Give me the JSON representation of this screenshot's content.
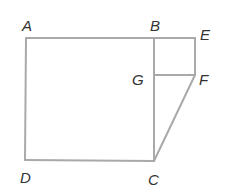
{
  "diagram": {
    "type": "geometry-figure",
    "line_color": "#a9a9a9",
    "label_color": "#333333",
    "points": {
      "A": {
        "label": "A",
        "x": 26,
        "y": 38
      },
      "B": {
        "label": "B",
        "x": 154,
        "y": 38
      },
      "E": {
        "label": "E",
        "x": 195,
        "y": 38
      },
      "G": {
        "label": "G",
        "x": 154,
        "y": 75
      },
      "F": {
        "label": "F",
        "x": 195,
        "y": 75
      },
      "C": {
        "label": "C",
        "x": 154,
        "y": 161
      },
      "D": {
        "label": "D",
        "x": 25,
        "y": 160
      }
    },
    "segments": [
      "AB",
      "BE",
      "EF",
      "FG",
      "BC",
      "CD",
      "DA",
      "FC"
    ]
  }
}
